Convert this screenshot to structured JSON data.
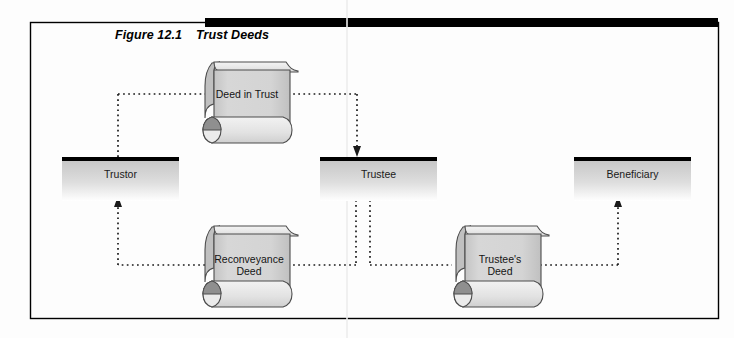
{
  "figure": {
    "number": "Figure 12.1",
    "title": "Trust Deeds",
    "frame": {
      "border_color": "#000000",
      "bar_color": "#000000",
      "background": "#fdfdfd"
    }
  },
  "parties": [
    {
      "id": "trustor",
      "label": "Trustor"
    },
    {
      "id": "trustee",
      "label": "Trustee"
    },
    {
      "id": "beneficiary",
      "label": "Beneficiary"
    }
  ],
  "documents": [
    {
      "id": "deed-in-trust",
      "label_line1": "Deed in Trust",
      "label_line2": ""
    },
    {
      "id": "reconveyance-deed",
      "label_line1": "Reconveyance",
      "label_line2": "Deed"
    },
    {
      "id": "trustees-deed",
      "label_line1": "Trustee's",
      "label_line2": "Deed"
    }
  ],
  "colors": {
    "scroll_fill": "#d2d2d2",
    "scroll_roll": "#e9e9e9",
    "scroll_cap": "#9a9a9a",
    "scroll_stroke": "#4d4d4d",
    "box_top_bar": "#000000",
    "box_gradient_top": "#c8c8c8",
    "box_gradient_bottom": "#ffffff",
    "connector": "#1a1a1a"
  },
  "connectors": [
    {
      "id": "trustor-to-deed-in-trust",
      "from": "trustor",
      "to": "deed-in-trust",
      "style": "dotted",
      "arrow": "none"
    },
    {
      "id": "deed-in-trust-to-trustee",
      "from": "deed-in-trust",
      "to": "trustee",
      "style": "dotted",
      "arrow": "down"
    },
    {
      "id": "trustee-to-reconveyance-deed",
      "from": "trustee",
      "to": "reconveyance-deed",
      "style": "dotted",
      "arrow": "none"
    },
    {
      "id": "reconveyance-deed-to-trustor",
      "from": "reconveyance-deed",
      "to": "trustor",
      "style": "dotted",
      "arrow": "up"
    },
    {
      "id": "trustee-to-trustees-deed",
      "from": "trustee",
      "to": "trustees-deed",
      "style": "dotted",
      "arrow": "none"
    },
    {
      "id": "trustees-deed-to-beneficiary",
      "from": "trustees-deed",
      "to": "beneficiary",
      "style": "dotted",
      "arrow": "up"
    }
  ]
}
